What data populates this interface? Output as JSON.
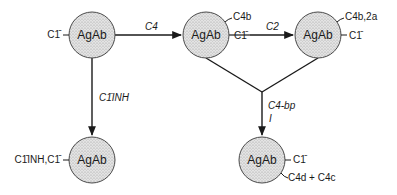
{
  "diagram": {
    "nodes": [
      {
        "id": "n1",
        "label": "AgAb",
        "x": 92,
        "y": 35,
        "side_labels": [
          {
            "text": "C1̄",
            "pos": "left"
          }
        ]
      },
      {
        "id": "n2",
        "label": "AgAb",
        "x": 206,
        "y": 35,
        "side_labels": [
          {
            "text": "C4b",
            "pos": "upper-right"
          },
          {
            "text": "C1̄",
            "pos": "right"
          }
        ]
      },
      {
        "id": "n3",
        "label": "AgAb",
        "x": 318,
        "y": 35,
        "side_labels": [
          {
            "text": "C4b,2a",
            "pos": "upper-right"
          },
          {
            "text": "C1̄",
            "pos": "right"
          }
        ]
      },
      {
        "id": "n4",
        "label": "AgAb",
        "x": 92,
        "y": 160,
        "side_labels": [
          {
            "text": "C1̄INH,C1̄",
            "pos": "left"
          }
        ]
      },
      {
        "id": "n5",
        "label": "AgAb",
        "x": 262,
        "y": 160,
        "side_labels": [
          {
            "text": "C1̄",
            "pos": "right"
          },
          {
            "text": "C4d + C4c",
            "pos": "lower-right"
          }
        ]
      }
    ],
    "edges": [
      {
        "from": "n1",
        "to": "n2",
        "label": "C4"
      },
      {
        "from": "n2",
        "to": "n3",
        "label": "C2"
      },
      {
        "from": "n1",
        "to": "n4",
        "label": "C1̄INH"
      },
      {
        "from": "n2+n3",
        "to": "n5",
        "label_line1": "C4-bp",
        "label_line2": "I"
      }
    ],
    "colors": {
      "line": "#1a1a1a",
      "node_fill": "#d9d9d9",
      "background": "#ffffff"
    }
  }
}
